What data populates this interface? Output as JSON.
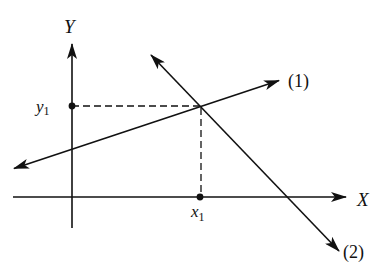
{
  "diagram": {
    "title": "",
    "axes": {
      "x_label": "X",
      "y_label": "Y"
    },
    "lines": [
      {
        "id": "line-1",
        "label": "(1)",
        "from": [
          12,
          169
        ],
        "to": [
          281,
          80
        ]
      },
      {
        "id": "line-2",
        "label": "(2)",
        "from": [
          150,
          54
        ],
        "to": [
          340,
          252
        ]
      }
    ],
    "intersection": {
      "x_label": "x",
      "x_sub": "1",
      "y_label": "y",
      "y_sub": "1",
      "point": [
        201,
        106
      ]
    },
    "colors": {
      "ink": "#111111",
      "background": "#ffffff"
    }
  }
}
